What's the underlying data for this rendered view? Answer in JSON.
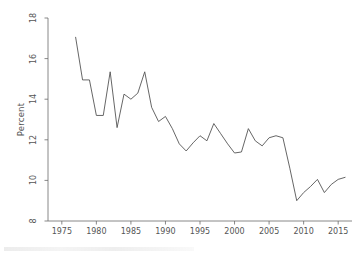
{
  "chart_data": {
    "type": "line",
    "title": "",
    "subtitle": "",
    "xlabel": "",
    "ylabel": "Percent",
    "xlim": [
      1973,
      2017
    ],
    "ylim": [
      8,
      18
    ],
    "grid": false,
    "legend": false,
    "legend_position": "none",
    "line_color": "#555555",
    "x_ticks": [
      1975,
      1980,
      1985,
      1990,
      1995,
      2000,
      2005,
      2010,
      2015
    ],
    "x_tick_labels": [
      "1975",
      "1980",
      "1985",
      "1990",
      "1995",
      "2000",
      "2005",
      "2010",
      "2015"
    ],
    "y_ticks": [
      8,
      10,
      12,
      14,
      16,
      18
    ],
    "y_tick_labels": [
      "8",
      "10",
      "12",
      "14",
      "16",
      "18"
    ],
    "series": [
      {
        "name": "Percent",
        "x": [
          1977,
          1978,
          1979,
          1980,
          1981,
          1982,
          1983,
          1984,
          1985,
          1986,
          1987,
          1988,
          1989,
          1990,
          1991,
          1992,
          1993,
          1994,
          1995,
          1996,
          1997,
          1998,
          1999,
          2000,
          2001,
          2002,
          2003,
          2004,
          2005,
          2006,
          2007,
          2008,
          2009,
          2010,
          2011,
          2012,
          2013,
          2014,
          2015,
          2016
        ],
        "values": [
          17.05,
          14.95,
          14.95,
          13.2,
          13.2,
          15.35,
          12.6,
          14.25,
          14.0,
          14.3,
          15.35,
          13.6,
          12.9,
          13.15,
          12.55,
          11.8,
          11.45,
          11.85,
          12.2,
          11.95,
          12.8,
          12.3,
          11.8,
          11.35,
          11.4,
          12.55,
          11.95,
          11.7,
          12.1,
          12.2,
          12.1,
          10.6,
          9.0,
          9.4,
          9.7,
          10.05,
          9.4,
          9.8,
          10.05,
          10.15
        ]
      }
    ]
  },
  "axes": {
    "ylabel_text": "Percent"
  }
}
